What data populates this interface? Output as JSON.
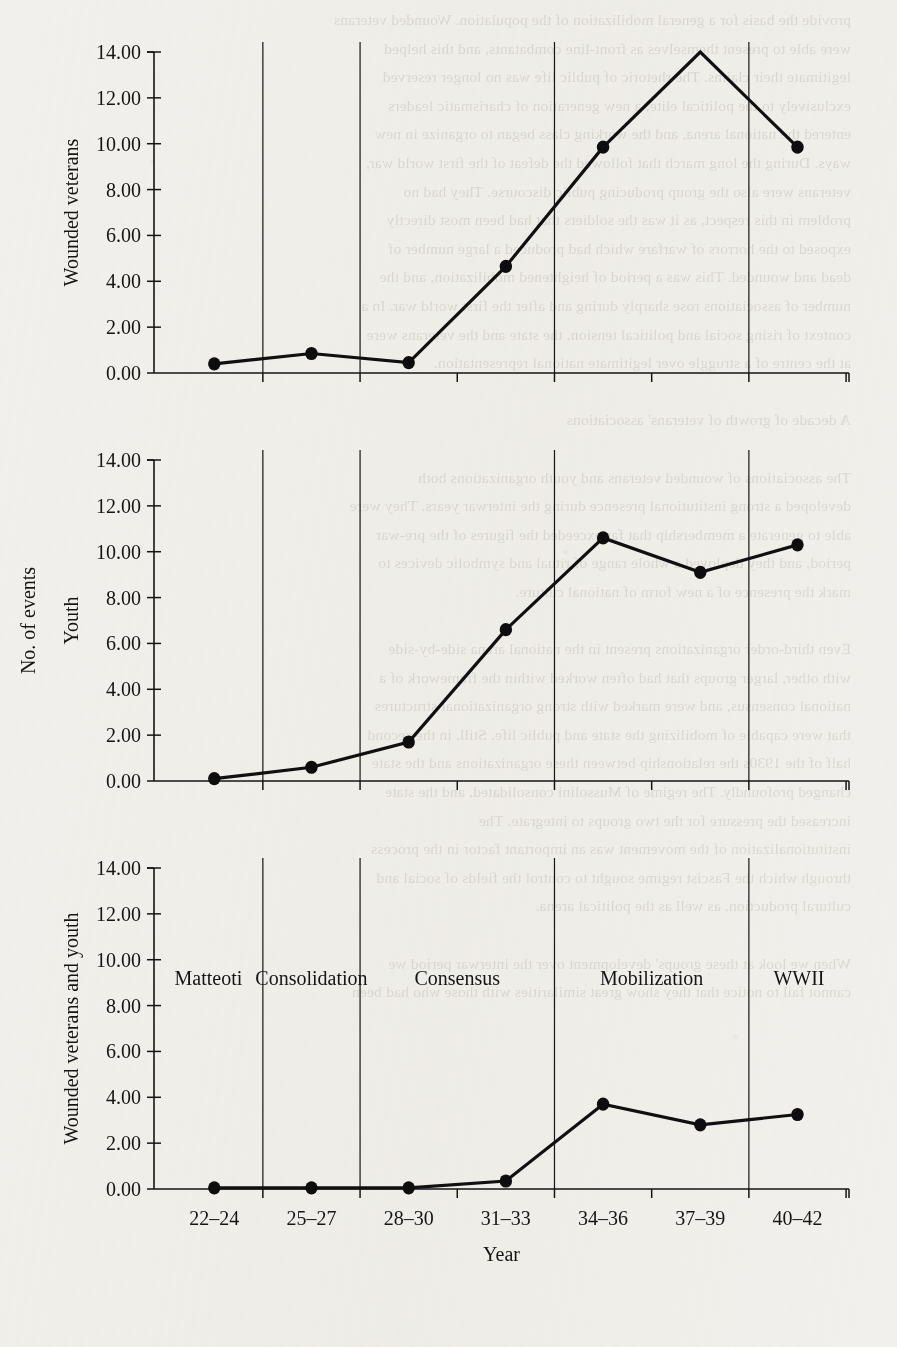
{
  "page": {
    "background_color": "#f2f0ec",
    "ink_color": "#151515",
    "bleed_text": "provide the basis for a general mobilization of the population. Wounded veterans\nwere able to present themselves as front-line combatants, and this helped\nlegitimate their claims. The rhetoric of public life was no longer reserved\nexclusively to the political elite, a new generation of charismatic leaders\nentered the national arena, and the working class began to organize in new\nways. During the long march that followed the defeat of the first world war,\nveterans were also the group producing public discourse. They had no\nproblem in this respect, as it was the soldiers that had been most directly\nexposed to the horrors of warfare which had produced a large number of\ndead and wounded. This was a period of heightened mobilization, and the\nnumber of associations rose sharply during and after the first world war. In a\ncontext of rising social and political tension, the state and the veterans were\nat the centre of a struggle over legitimate national representation.\n\nA decade of growth of veterans' associations\n\nThe associations of wounded veterans and youth organizations both\ndeveloped a strong institutional presence during the interwar years. They were\nable to generate a membership that far exceeded the figures of the pre-war\nperiod, and they deployed a whole range of ritual and symbolic devices to\nmark the presence of a new form of national culture.\n\nEven third-order organizations present in the national arena side-by-side\nwith other, larger groups that had often worked within the framework of a\nnational consensus, and were marked with strong organizational structures\nthat were capable of mobilizing the state and public life. Still, in the second\nhalf of the 1930s the relationship between these organizations and the state\nchanged profoundly. The regime of Mussolini consolidated, and the state\nincreased the pressure for the two groups to integrate. The\ninstitutionalization of the movement was an important factor in the process\nthrough which the Fascist regime sought to control the fields of social and\ncultural production, as well as the political arena.\n\nWhen we look at these groups' development over the interwar period we\ncannot fail to notice that they show great similarities with those who had been"
  },
  "chart_data": [
    {
      "type": "line",
      "id": "wounded-veterans",
      "title": "",
      "ylabel": "Wounded veterans",
      "xlabel": "",
      "categories": [
        "22-24",
        "25-27",
        "28-30",
        "31-33",
        "34-36",
        "37-39",
        "40-42"
      ],
      "yticks": [
        "0.00",
        "2.00",
        "4.00",
        "6.00",
        "8.00",
        "10.00",
        "12.00",
        "14.00"
      ],
      "ylim": [
        0,
        14
      ],
      "values": [
        0.4,
        0.85,
        0.45,
        4.65,
        9.85,
        14.0,
        9.85
      ],
      "markers": [
        true,
        true,
        true,
        true,
        true,
        false,
        true
      ],
      "grid": false,
      "legend": "none",
      "period_dividers_after": [
        1,
        2,
        4,
        6
      ],
      "show_xticklabels": false
    },
    {
      "type": "line",
      "id": "youth",
      "title": "",
      "ylabel": "Youth",
      "ylabel_outer": "No. of events",
      "xlabel": "",
      "categories": [
        "22-24",
        "25-27",
        "28-30",
        "31-33",
        "34-36",
        "37-39",
        "40-42"
      ],
      "yticks": [
        "0.00",
        "2.00",
        "4.00",
        "6.00",
        "8.00",
        "10.00",
        "12.00",
        "14.00"
      ],
      "ylim": [
        0,
        14
      ],
      "values": [
        0.1,
        0.6,
        1.7,
        6.6,
        10.6,
        9.1,
        10.3
      ],
      "markers": [
        true,
        true,
        true,
        true,
        true,
        true,
        true
      ],
      "grid": false,
      "legend": "none",
      "period_dividers_after": [
        1,
        2,
        4,
        6
      ],
      "show_xticklabels": false
    },
    {
      "type": "line",
      "id": "wounded-veterans-and-youth",
      "title": "",
      "ylabel": "Wounded veterans and youth",
      "xlabel": "Year",
      "categories": [
        "22-24",
        "25-27",
        "28-30",
        "31-33",
        "34-36",
        "37-39",
        "40-42"
      ],
      "yticks": [
        "0.00",
        "2.00",
        "4.00",
        "6.00",
        "8.00",
        "10.00",
        "12.00",
        "14.00"
      ],
      "ylim": [
        0,
        14
      ],
      "values": [
        0.05,
        0.05,
        0.05,
        0.35,
        3.7,
        2.8,
        3.25
      ],
      "markers": [
        true,
        true,
        true,
        true,
        true,
        true,
        true
      ],
      "grid": false,
      "legend": "none",
      "period_dividers_after": [
        1,
        2,
        4,
        6
      ],
      "show_xticklabels": true,
      "period_labels": [
        "Matteoti",
        "Consolidation",
        "Consensus",
        "Mobilization",
        "WWII"
      ],
      "period_label_y_value": 8.9
    }
  ]
}
